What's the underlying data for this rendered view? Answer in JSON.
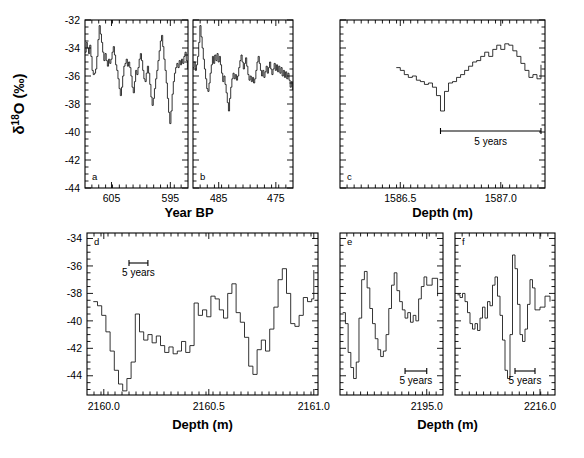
{
  "figure": {
    "y_axis_label": "δ18O (‰)",
    "y_axis_label_parts": {
      "delta": "δ",
      "sup": "18",
      "rest": "O (‰)"
    },
    "x_axis_label_top": "Year BP",
    "x_axis_label_bottom_left": "Depth (m)",
    "x_axis_label_bottom_right": "Depth (m)",
    "x_axis_label_c": "Depth (m)",
    "scale_bar_label": "5 years",
    "background_color": "#ffffff",
    "line_color": "#111111"
  },
  "chart_data": [
    {
      "type": "line",
      "panel": "a",
      "title": "",
      "xlabel": "Year BP",
      "ylabel": "δ18O (‰)",
      "xlim": [
        609.5,
        592.0
      ],
      "ylim": [
        -44,
        -32
      ],
      "xticks": [
        605,
        595
      ],
      "yticks": [
        -32,
        -34,
        -36,
        -38,
        -40,
        -42,
        -44
      ],
      "x_reversed": true,
      "grid": false,
      "x": [
        609.5,
        609.3,
        609.1,
        608.9,
        608.7,
        608.5,
        608.3,
        608.1,
        607.9,
        607.7,
        607.5,
        607.3,
        607.1,
        606.9,
        606.7,
        606.5,
        606.3,
        606.1,
        605.9,
        605.7,
        605.5,
        605.3,
        605.1,
        604.9,
        604.7,
        604.5,
        604.3,
        604.1,
        603.9,
        603.7,
        603.5,
        603.3,
        603.1,
        602.9,
        602.7,
        602.5,
        602.3,
        602.1,
        601.9,
        601.7,
        601.5,
        601.3,
        601.1,
        600.9,
        600.7,
        600.5,
        600.3,
        600.1,
        599.9,
        599.7,
        599.5,
        599.3,
        599.1,
        598.9,
        598.7,
        598.5,
        598.3,
        598.1,
        597.9,
        597.7,
        597.5,
        597.3,
        597.1,
        596.9,
        596.7,
        596.5,
        596.3,
        596.1,
        595.9,
        595.7,
        595.5,
        595.3,
        595.1,
        594.9,
        594.7,
        594.5,
        594.3,
        594.1,
        593.9,
        593.7,
        593.5,
        593.3,
        593.1,
        592.9,
        592.7,
        592.5,
        592.3,
        592.1
      ],
      "values": [
        -34.3,
        -33.6,
        -34.0,
        -34.4,
        -33.8,
        -34.6,
        -35.6,
        -35.9,
        -35.8,
        -35.5,
        -34.6,
        -33.4,
        -32.4,
        -33.0,
        -33.6,
        -34.3,
        -34.9,
        -34.4,
        -34.9,
        -35.3,
        -34.8,
        -35.1,
        -34.8,
        -34.3,
        -33.9,
        -34.5,
        -35.2,
        -35.6,
        -36.2,
        -36.9,
        -37.4,
        -36.8,
        -36.0,
        -35.3,
        -35.1,
        -34.8,
        -35.3,
        -35.0,
        -35.4,
        -36.0,
        -36.8,
        -37.2,
        -36.4,
        -35.6,
        -35.9,
        -35.4,
        -34.8,
        -34.4,
        -34.9,
        -35.6,
        -36.2,
        -36.4,
        -35.8,
        -35.3,
        -35.8,
        -36.6,
        -37.5,
        -38.1,
        -37.6,
        -36.9,
        -36.2,
        -35.6,
        -34.9,
        -34.2,
        -33.5,
        -33.1,
        -33.9,
        -34.8,
        -35.6,
        -36.5,
        -37.6,
        -38.6,
        -39.4,
        -38.5,
        -37.3,
        -36.4,
        -35.8,
        -35.4,
        -35.1,
        -35.4,
        -34.9,
        -35.2,
        -34.8,
        -35.1,
        -34.6,
        -34.3,
        -34.9,
        -35.5
      ],
      "annotations": []
    },
    {
      "type": "line",
      "panel": "b",
      "title": "",
      "xlabel": "Year BP",
      "ylabel": "δ18O (‰)",
      "xlim": [
        489.5,
        472.0
      ],
      "ylim": [
        -44,
        -32
      ],
      "xticks": [
        485,
        475
      ],
      "yticks": [
        -32,
        -34,
        -36,
        -38,
        -40,
        -42,
        -44
      ],
      "x_reversed": true,
      "grid": false,
      "x": [
        489.5,
        489.3,
        489.1,
        488.9,
        488.7,
        488.5,
        488.3,
        488.1,
        487.9,
        487.7,
        487.5,
        487.3,
        487.1,
        486.9,
        486.7,
        486.5,
        486.3,
        486.1,
        485.9,
        485.7,
        485.5,
        485.3,
        485.1,
        484.9,
        484.7,
        484.5,
        484.3,
        484.1,
        483.9,
        483.7,
        483.5,
        483.3,
        483.1,
        482.9,
        482.7,
        482.5,
        482.3,
        482.1,
        481.9,
        481.7,
        481.5,
        481.3,
        481.1,
        480.9,
        480.7,
        480.5,
        480.3,
        480.1,
        479.9,
        479.7,
        479.5,
        479.3,
        479.1,
        478.9,
        478.7,
        478.5,
        478.3,
        478.1,
        477.9,
        477.7,
        477.5,
        477.3,
        477.1,
        476.9,
        476.7,
        476.5,
        476.3,
        476.1,
        475.9,
        475.7,
        475.5,
        475.3,
        475.1,
        474.9,
        474.7,
        474.5,
        474.3,
        474.1,
        473.9,
        473.7,
        473.5,
        473.3,
        473.1,
        472.9,
        472.7,
        472.5,
        472.3,
        472.1
      ],
      "values": [
        -35.4,
        -35.0,
        -35.6,
        -35.2,
        -34.6,
        -33.6,
        -32.4,
        -33.2,
        -34.0,
        -34.8,
        -35.5,
        -36.2,
        -36.9,
        -37.1,
        -36.5,
        -35.8,
        -35.2,
        -34.6,
        -35.1,
        -34.5,
        -34.9,
        -34.4,
        -35.0,
        -34.6,
        -35.2,
        -35.8,
        -36.4,
        -36.0,
        -36.6,
        -37.2,
        -37.9,
        -38.5,
        -37.6,
        -36.8,
        -36.2,
        -35.8,
        -36.2,
        -35.9,
        -36.3,
        -36.0,
        -35.4,
        -34.9,
        -34.5,
        -35.0,
        -35.5,
        -35.1,
        -34.7,
        -35.3,
        -35.9,
        -36.3,
        -36.0,
        -36.4,
        -36.1,
        -36.5,
        -36.2,
        -35.6,
        -35.0,
        -34.6,
        -35.1,
        -35.6,
        -36.0,
        -35.6,
        -36.1,
        -35.7,
        -35.3,
        -35.8,
        -35.4,
        -35.0,
        -35.5,
        -35.9,
        -35.5,
        -35.1,
        -35.6,
        -35.2,
        -35.7,
        -35.3,
        -35.8,
        -35.4,
        -36.0,
        -35.6,
        -36.1,
        -35.7,
        -36.2,
        -35.8,
        -36.3,
        -36.8,
        -36.4,
        -37.0
      ],
      "annotations": []
    },
    {
      "type": "line",
      "panel": "c",
      "title": "",
      "xlabel": "Depth (m)",
      "ylabel": "δ18O (‰)",
      "xlim": [
        1586.2,
        1587.22
      ],
      "ylim": [
        -44,
        -32
      ],
      "xticks": [
        1586.5,
        1587.0
      ],
      "yticks": [
        -32,
        -34,
        -36,
        -38,
        -40,
        -42,
        -44
      ],
      "x_reversed": false,
      "grid": false,
      "scale_bar": {
        "label": "5 years",
        "x_start": 1586.7,
        "x_end": 1587.2
      },
      "x": [
        1586.48,
        1586.5,
        1586.52,
        1586.54,
        1586.56,
        1586.58,
        1586.6,
        1586.62,
        1586.64,
        1586.66,
        1586.68,
        1586.7,
        1586.72,
        1586.74,
        1586.76,
        1586.78,
        1586.8,
        1586.82,
        1586.84,
        1586.86,
        1586.88,
        1586.9,
        1586.92,
        1586.94,
        1586.96,
        1586.98,
        1587.0,
        1587.02,
        1587.04,
        1587.06,
        1587.08,
        1587.1,
        1587.12,
        1587.14,
        1587.16,
        1587.18,
        1587.2
      ],
      "values": [
        -35.4,
        -35.6,
        -35.9,
        -36.1,
        -36.0,
        -36.3,
        -36.4,
        -36.6,
        -36.5,
        -36.8,
        -37.4,
        -38.5,
        -37.1,
        -36.5,
        -36.4,
        -36.1,
        -35.9,
        -35.6,
        -35.3,
        -35.0,
        -34.9,
        -34.6,
        -34.3,
        -34.6,
        -34.1,
        -33.8,
        -34.1,
        -33.7,
        -33.8,
        -34.2,
        -34.6,
        -35.1,
        -35.6,
        -36.1,
        -35.9,
        -36.2,
        -35.2
      ],
      "annotations": [
        {
          "text": "5 years",
          "type": "scale_bar_label"
        }
      ]
    },
    {
      "type": "line",
      "panel": "d",
      "title": "",
      "xlabel": "Depth (m)",
      "ylabel": "δ18O (‰)",
      "xlim": [
        2159.92,
        2161.02
      ],
      "ylim": [
        -45.4,
        -33.6
      ],
      "xticks": [
        2160.0,
        2160.5,
        2161.0
      ],
      "yticks": [
        -34,
        -36,
        -38,
        -40,
        -42,
        -44
      ],
      "x_reversed": false,
      "grid": false,
      "scale_bar": {
        "label": "5 years",
        "x_start": 2160.12,
        "x_end": 2160.21
      },
      "x": [
        2159.95,
        2159.97,
        2159.99,
        2160.01,
        2160.03,
        2160.05,
        2160.07,
        2160.09,
        2160.11,
        2160.13,
        2160.15,
        2160.17,
        2160.19,
        2160.21,
        2160.23,
        2160.25,
        2160.27,
        2160.29,
        2160.31,
        2160.33,
        2160.35,
        2160.37,
        2160.39,
        2160.41,
        2160.43,
        2160.45,
        2160.47,
        2160.49,
        2160.51,
        2160.53,
        2160.55,
        2160.57,
        2160.59,
        2160.61,
        2160.63,
        2160.65,
        2160.67,
        2160.69,
        2160.71,
        2160.73,
        2160.75,
        2160.77,
        2160.79,
        2160.81,
        2160.83,
        2160.85,
        2160.87,
        2160.89,
        2160.91,
        2160.93,
        2160.95,
        2160.97,
        2160.99,
        2161.0
      ],
      "values": [
        -38.6,
        -38.9,
        -39.6,
        -40.8,
        -42.2,
        -43.6,
        -44.6,
        -45.1,
        -44.2,
        -43.0,
        -39.5,
        -40.8,
        -41.4,
        -41.0,
        -41.6,
        -41.1,
        -41.8,
        -42.3,
        -41.9,
        -42.4,
        -42.2,
        -41.5,
        -42.3,
        -41.8,
        -38.7,
        -39.6,
        -39.2,
        -39.7,
        -38.2,
        -38.4,
        -39.2,
        -39.8,
        -38.0,
        -37.3,
        -39.4,
        -40.1,
        -41.2,
        -43.3,
        -43.9,
        -42.1,
        -41.4,
        -42.2,
        -40.6,
        -39.0,
        -37.0,
        -36.2,
        -38.0,
        -40.2,
        -40.4,
        -39.6,
        -38.3,
        -38.6,
        -38.4,
        -36.3
      ],
      "annotations": [
        {
          "text": "5 years",
          "type": "scale_bar_label"
        }
      ]
    },
    {
      "type": "line",
      "panel": "e",
      "title": "",
      "xlabel": "Depth (m)",
      "ylabel": "δ18O (‰)",
      "xlim": [
        2194.68,
        2195.06
      ],
      "ylim": [
        -45.4,
        -33.6
      ],
      "xticks": [
        2195.0
      ],
      "yticks": [
        -34,
        -36,
        -38,
        -40,
        -42,
        -44
      ],
      "x_reversed": false,
      "grid": false,
      "scale_bar": {
        "label": "5 years",
        "x_start": 2194.92,
        "x_end": 2195.0
      },
      "x": [
        2194.69,
        2194.7,
        2194.71,
        2194.72,
        2194.73,
        2194.74,
        2194.75,
        2194.76,
        2194.77,
        2194.78,
        2194.79,
        2194.8,
        2194.81,
        2194.82,
        2194.83,
        2194.84,
        2194.85,
        2194.86,
        2194.87,
        2194.88,
        2194.89,
        2194.9,
        2194.91,
        2194.92,
        2194.93,
        2194.94,
        2194.95,
        2194.96,
        2194.97,
        2194.98,
        2194.99,
        2195.0,
        2195.02,
        2195.04
      ],
      "values": [
        -39.4,
        -40.2,
        -42.3,
        -43.4,
        -44.2,
        -43.0,
        -39.8,
        -37.0,
        -36.4,
        -37.6,
        -39.1,
        -40.2,
        -41.3,
        -42.1,
        -42.6,
        -42.2,
        -41.0,
        -39.1,
        -37.4,
        -36.5,
        -37.8,
        -38.6,
        -39.2,
        -39.8,
        -39.4,
        -40.1,
        -39.6,
        -40.0,
        -38.4,
        -37.5,
        -36.8,
        -37.4,
        -36.9,
        -38.2
      ],
      "annotations": [
        {
          "text": "5 years",
          "type": "scale_bar_label"
        }
      ]
    },
    {
      "type": "line",
      "panel": "f",
      "title": "",
      "xlabel": "Depth (m)",
      "ylabel": "δ18O (‰)",
      "xlim": [
        2215.66,
        2216.06
      ],
      "ylim": [
        -45.4,
        -33.6
      ],
      "xticks": [
        2216.0
      ],
      "yticks": [
        -34,
        -36,
        -38,
        -40,
        -42,
        -44
      ],
      "x_reversed": false,
      "grid": false,
      "scale_bar": {
        "label": "5 years",
        "x_start": 2215.9,
        "x_end": 2215.98
      },
      "x": [
        2215.67,
        2215.68,
        2215.69,
        2215.7,
        2215.71,
        2215.72,
        2215.73,
        2215.74,
        2215.75,
        2215.76,
        2215.77,
        2215.78,
        2215.79,
        2215.8,
        2215.81,
        2215.82,
        2215.83,
        2215.84,
        2215.85,
        2215.86,
        2215.87,
        2215.88,
        2215.89,
        2215.9,
        2215.91,
        2215.92,
        2215.93,
        2215.94,
        2215.95,
        2215.96,
        2215.97,
        2215.98,
        2216.0,
        2216.02,
        2216.04
      ],
      "values": [
        -38.1,
        -38.3,
        -38.0,
        -38.6,
        -39.4,
        -40.2,
        -40.6,
        -40.2,
        -40.7,
        -39.8,
        -39.0,
        -39.8,
        -38.6,
        -38.9,
        -37.4,
        -36.8,
        -38.2,
        -39.6,
        -41.4,
        -43.6,
        -44.2,
        -41.0,
        -35.2,
        -36.2,
        -38.8,
        -41.0,
        -41.5,
        -40.6,
        -38.8,
        -37.0,
        -37.6,
        -39.2,
        -39.0,
        -38.2,
        -38.6
      ],
      "annotations": [
        {
          "text": "5 years",
          "type": "scale_bar_label"
        }
      ]
    }
  ],
  "panels": {
    "a": {
      "label": "a",
      "xticklabels": [
        "605",
        "595"
      ]
    },
    "b": {
      "label": "b",
      "xticklabels": [
        "485",
        "475"
      ]
    },
    "c": {
      "label": "c",
      "xticklabels": [
        "1586.5",
        "1587.0"
      ],
      "scale": "5 years"
    },
    "d": {
      "label": "d",
      "xticklabels": [
        "2160.0",
        "2160.5",
        "2161.0"
      ],
      "scale": "5 years"
    },
    "e": {
      "label": "e",
      "xticklabels": [
        "2195.0"
      ],
      "scale": "5 years"
    },
    "f": {
      "label": "f",
      "xticklabels": [
        "2216.0"
      ],
      "scale": "5 years"
    }
  },
  "yticklabels_top": [
    "-32",
    "-34",
    "-36",
    "-38",
    "-40",
    "-42",
    "-44"
  ],
  "yticklabels_bottom": [
    "-34",
    "-36",
    "-38",
    "-40",
    "-42",
    "-44"
  ]
}
